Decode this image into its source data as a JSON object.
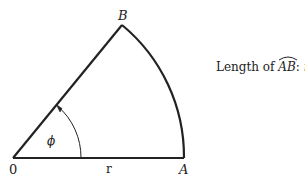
{
  "diagram": {
    "type": "circular-sector",
    "points": {
      "origin": "0",
      "a": "A",
      "b": "B"
    },
    "labels": {
      "radius": "r",
      "angle": "ϕ"
    },
    "caption": {
      "prefix": "Length of ",
      "arc": "AB",
      "colon": ": ",
      "formula": "rϕ"
    },
    "colors": {
      "stroke": "#222222",
      "background": "#ffffff"
    }
  }
}
